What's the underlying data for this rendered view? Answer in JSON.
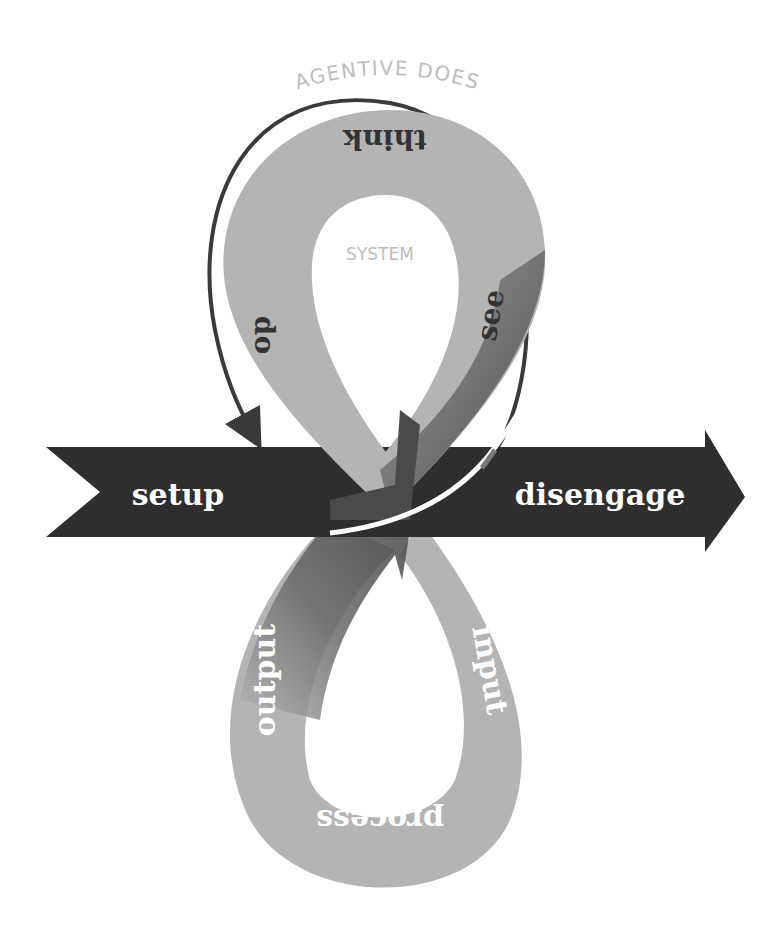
{
  "diagram": {
    "top_label": "AGENTIVE DOES",
    "system_label": "SYSTEM",
    "upper_loop": {
      "think": "think",
      "see": "see",
      "do": "do"
    },
    "lower_loop": {
      "input": "input",
      "process": "process",
      "output": "output"
    },
    "band": {
      "left": "setup",
      "right": "disengage"
    }
  },
  "colors": {
    "loop_light": "#b4b4b4",
    "loop_dark": "#5a5a5a",
    "band": "#2e2e2e",
    "outer_arrow": "#3a3a3a",
    "label_gray": "#bdbdbd",
    "band_text": "#ffffff",
    "loop_text_dark": "#333333",
    "loop_text_light": "#ffffff"
  }
}
